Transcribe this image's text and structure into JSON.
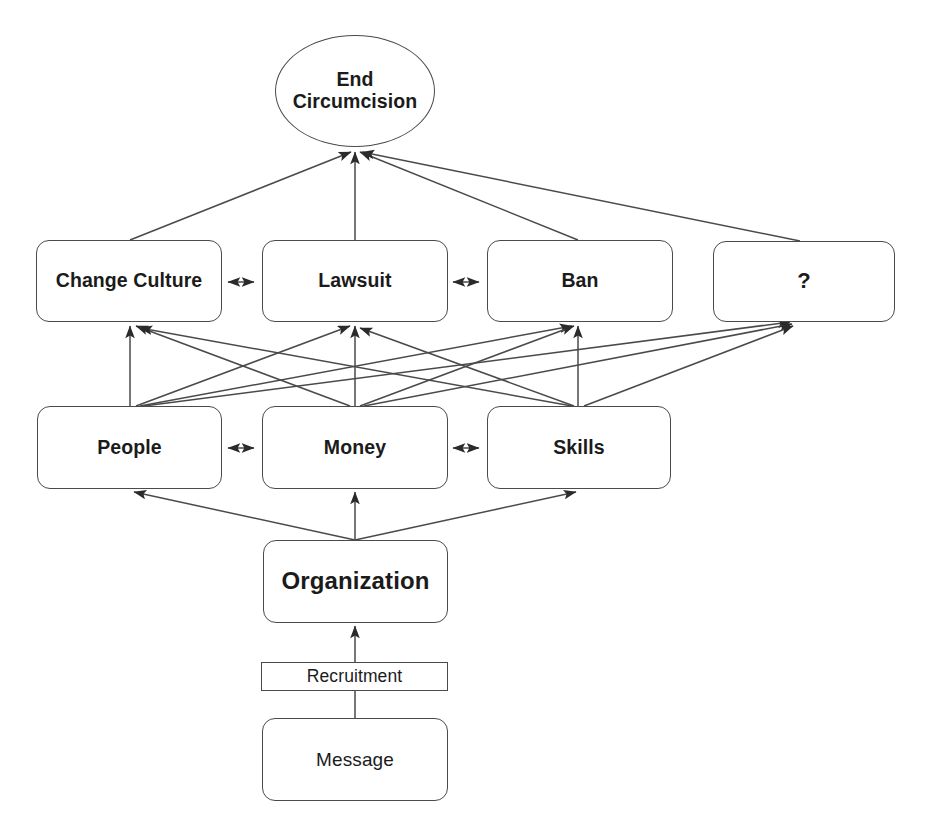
{
  "diagram": {
    "background_color": "#ffffff",
    "line_color": "#4a4a4a",
    "text_color": "#1b1b1b",
    "nodes": {
      "goal": {
        "label": "End\nCircumcision",
        "line1": "End",
        "line2": "Circumcision",
        "shape": "ellipse"
      },
      "change_culture": {
        "label": "Change Culture",
        "shape": "rounded-rect"
      },
      "lawsuit": {
        "label": "Lawsuit",
        "shape": "rounded-rect"
      },
      "ban": {
        "label": "Ban",
        "shape": "rounded-rect"
      },
      "unknown": {
        "label": "?",
        "shape": "rounded-rect"
      },
      "people": {
        "label": "People",
        "shape": "rounded-rect"
      },
      "money": {
        "label": "Money",
        "shape": "rounded-rect"
      },
      "skills": {
        "label": "Skills",
        "shape": "rounded-rect"
      },
      "organization": {
        "label": "Organization",
        "shape": "rounded-rect"
      },
      "recruitment": {
        "label": "Recruitment",
        "shape": "rect"
      },
      "message": {
        "label": "Message",
        "shape": "rounded-rect"
      }
    },
    "edges": [
      {
        "from": "change_culture",
        "to": "goal",
        "type": "arrow"
      },
      {
        "from": "lawsuit",
        "to": "goal",
        "type": "arrow"
      },
      {
        "from": "ban",
        "to": "goal",
        "type": "arrow"
      },
      {
        "from": "unknown",
        "to": "goal",
        "type": "arrow"
      },
      {
        "from": "change_culture",
        "to": "lawsuit",
        "type": "double-arrow"
      },
      {
        "from": "lawsuit",
        "to": "ban",
        "type": "double-arrow"
      },
      {
        "from": "people",
        "to": "change_culture",
        "type": "arrow"
      },
      {
        "from": "people",
        "to": "lawsuit",
        "type": "arrow"
      },
      {
        "from": "people",
        "to": "ban",
        "type": "arrow"
      },
      {
        "from": "people",
        "to": "unknown",
        "type": "arrow"
      },
      {
        "from": "money",
        "to": "change_culture",
        "type": "arrow"
      },
      {
        "from": "money",
        "to": "lawsuit",
        "type": "arrow"
      },
      {
        "from": "money",
        "to": "ban",
        "type": "arrow"
      },
      {
        "from": "money",
        "to": "unknown",
        "type": "arrow"
      },
      {
        "from": "skills",
        "to": "change_culture",
        "type": "arrow"
      },
      {
        "from": "skills",
        "to": "lawsuit",
        "type": "arrow"
      },
      {
        "from": "skills",
        "to": "ban",
        "type": "arrow"
      },
      {
        "from": "skills",
        "to": "unknown",
        "type": "arrow"
      },
      {
        "from": "people",
        "to": "money",
        "type": "double-arrow"
      },
      {
        "from": "money",
        "to": "skills",
        "type": "double-arrow"
      },
      {
        "from": "organization",
        "to": "people",
        "type": "arrow"
      },
      {
        "from": "organization",
        "to": "money",
        "type": "arrow"
      },
      {
        "from": "organization",
        "to": "skills",
        "type": "arrow"
      },
      {
        "from": "recruitment",
        "to": "organization",
        "type": "arrow"
      },
      {
        "from": "message",
        "to": "recruitment",
        "type": "line"
      }
    ]
  }
}
